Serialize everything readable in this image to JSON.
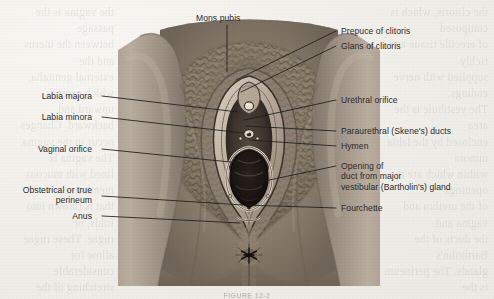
{
  "figure": {
    "caption": "FIGURE 12-2"
  },
  "colors": {
    "paper": "#f3f2ee",
    "label_text": "#2b2b2b",
    "leader_line": "#1d1d1d",
    "skin_light": "#b4a99c",
    "skin_mid": "#9a8d80",
    "skin_dark": "#6f6459",
    "mucosa_dark": "#2e2722",
    "hair_dark": "#4a423a"
  },
  "labels_left": [
    {
      "text": "Labia majora",
      "name": "label-labia-majora"
    },
    {
      "text": "Labia minora",
      "name": "label-labia-minora"
    },
    {
      "text": "Vaginal orifice",
      "name": "label-vaginal-orifice"
    },
    {
      "text": "Obstetrical or true\nperineum",
      "name": "label-obstetrical-perineum"
    },
    {
      "text": "Anus",
      "name": "label-anus"
    }
  ],
  "labels_top": [
    {
      "text": "Mons pubis",
      "name": "label-mons-pubis"
    }
  ],
  "labels_right": [
    {
      "text": "Prepuce of clitoris",
      "name": "label-prepuce-of-clitoris"
    },
    {
      "text": "Glans of clitoris",
      "name": "label-glans-of-clitoris"
    },
    {
      "text": "Urethral orifice",
      "name": "label-urethral-orifice"
    },
    {
      "text": "Paraurethral (Skene's) ducts",
      "name": "label-paraurethral-ducts"
    },
    {
      "text": "Hymen",
      "name": "label-hymen"
    },
    {
      "text": "Opening of\nduct from major\nvestibular (Bartholin's) gland",
      "name": "label-bartholins-gland-duct"
    },
    {
      "text": "Fourchette",
      "name": "label-fourchette"
    }
  ],
  "bleedthrough": {
    "left": "the vagina is the passage\nbetween the uterus and the\nexternal genitalia, which extends\nupward and backward. Changes\noccur in the vagina. The vagina is\nlined with mucous membrane\nthat is thrown into folds, or\nrugae. These rugae allow for\nconsiderable stretching of the\nvaginal walls during birth of\nthe fetus. The vaginal wall\nis lubricated by secretions\nfrom the cervix and from\nthe vestibular glands, and\ntransudate from the vaginal\nepithelium. The normal pH of\nthe vagina is acidic, ranging\nbetween 4 and 5, which helps\nprotect against infection by\npathogenic organisms. During\npregnancy the increase in\nvascularity gives the vaginal\nwall a bluish tint known as\nChadwick's sign, one of the\nearly probable indications.",
    "right": "the clitoris, which is composed\nof erectile tissue and richly\nsupplied with nerve endings.\nThe vestibule is the area\nenclosed by the labia minora\nwithin which are the openings\nof the urethra and vagina and\nthe ducts of the Bartholin's\nglands. The perineum is the\narea between the fourchette\nand the anus. Its muscular\nstructure has been described\nas a sling that supports the\npelvic organs. During childbirth\nthe perineum stretches markedly,\nand an episiotomy may be\nperformed to enlarge the\nvaginal opening. Knowledge\nof these structures is essential\nfor assessment and care of\nthe childbearing woman."
  }
}
